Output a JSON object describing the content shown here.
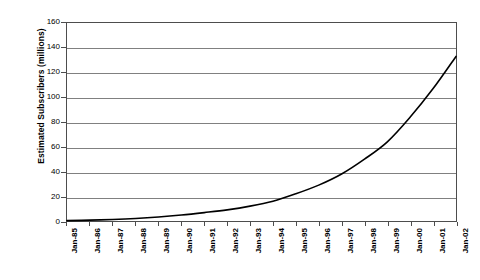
{
  "chart_data": {
    "type": "line",
    "title": "",
    "xlabel": "",
    "ylabel": "Estimated Subscribers (millions)",
    "ylim": [
      0,
      160
    ],
    "yticks": [
      0,
      20,
      40,
      60,
      80,
      100,
      120,
      140,
      160
    ],
    "ytick_labels": [
      "0",
      "20",
      "40",
      "60",
      "80",
      "100",
      "120",
      "140",
      "160"
    ],
    "grid": true,
    "legend": "none",
    "categories": [
      "Jan-85",
      "Jan-86",
      "Jan-87",
      "Jan-88",
      "Jan-89",
      "Jan-90",
      "Jan-91",
      "Jan-92",
      "Jan-93",
      "Jan-94",
      "Jan-95",
      "Jan-96",
      "Jan-97",
      "Jan-98",
      "Jan-99",
      "Jan-00",
      "Jan-01",
      "Jan-02"
    ],
    "values": [
      0.3,
      0.7,
      1.2,
      2.0,
      3.2,
      4.8,
      6.8,
      9.0,
      12.0,
      16.0,
      22.0,
      29.0,
      38.0,
      50.0,
      64.0,
      84.0,
      107.0,
      133.0
    ],
    "series": [
      {
        "name": "Estimated Subscribers",
        "color": "#000000",
        "values": [
          0.3,
          0.7,
          1.2,
          2.0,
          3.2,
          4.8,
          6.8,
          9.0,
          12.0,
          16.0,
          22.0,
          29.0,
          38.0,
          50.0,
          64.0,
          84.0,
          107.0,
          133.0
        ]
      }
    ]
  },
  "style": {
    "line_color": "#000000",
    "grid_color": "#808080",
    "axis_color": "#4d4d4d",
    "background": "#ffffff"
  }
}
